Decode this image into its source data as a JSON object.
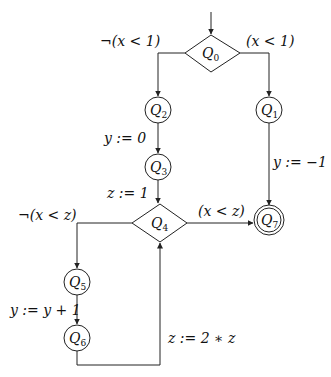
{
  "diagram": {
    "type": "control-flow-graph",
    "nodes": [
      {
        "id": "Q0",
        "label": "Q",
        "sub": "0",
        "shape": "diamond"
      },
      {
        "id": "Q1",
        "label": "Q",
        "sub": "1",
        "shape": "circle"
      },
      {
        "id": "Q2",
        "label": "Q",
        "sub": "2",
        "shape": "circle"
      },
      {
        "id": "Q3",
        "label": "Q",
        "sub": "3",
        "shape": "circle"
      },
      {
        "id": "Q4",
        "label": "Q",
        "sub": "4",
        "shape": "diamond"
      },
      {
        "id": "Q5",
        "label": "Q",
        "sub": "5",
        "shape": "circle"
      },
      {
        "id": "Q6",
        "label": "Q",
        "sub": "6",
        "shape": "circle"
      },
      {
        "id": "Q7",
        "label": "Q",
        "sub": "7",
        "shape": "double-circle"
      }
    ],
    "edges": [
      {
        "from": "start",
        "to": "Q0",
        "label": ""
      },
      {
        "from": "Q0",
        "to": "Q2",
        "label": "¬(x < 1)"
      },
      {
        "from": "Q0",
        "to": "Q1",
        "label": "(x < 1)"
      },
      {
        "from": "Q2",
        "to": "Q3",
        "label": "y := 0"
      },
      {
        "from": "Q3",
        "to": "Q4",
        "label": "z := 1"
      },
      {
        "from": "Q1",
        "to": "Q7",
        "label": "y := −1"
      },
      {
        "from": "Q4",
        "to": "Q7",
        "label": "(x < z)"
      },
      {
        "from": "Q4",
        "to": "Q5",
        "label": "¬(x < z)"
      },
      {
        "from": "Q5",
        "to": "Q6",
        "label": "y := y + 1"
      },
      {
        "from": "Q6",
        "to": "Q4",
        "label": "z := 2 ∗ z"
      }
    ]
  }
}
